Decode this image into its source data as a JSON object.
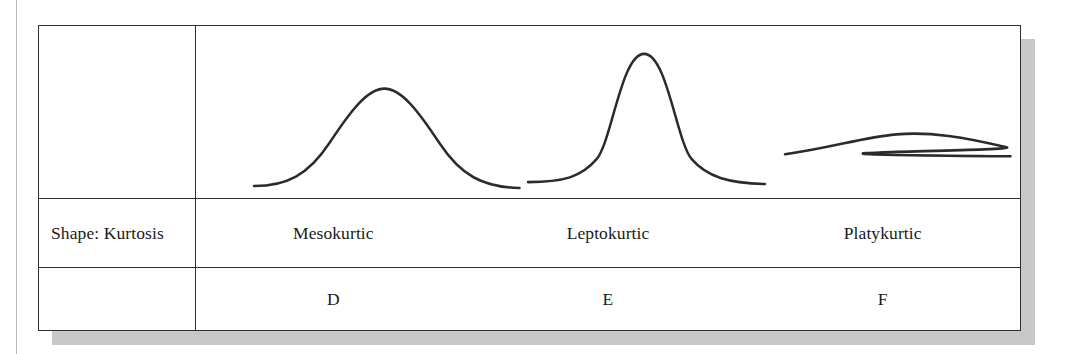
{
  "figure": {
    "kind": "kurtosis-comparison-table",
    "row_label": "Shape: Kurtosis",
    "empty_label": ""
  },
  "colors": {
    "line": "#2b2b2b",
    "border": "#2e2e2e",
    "shadow": "#c8c8c8",
    "background": "#ffffff",
    "gutter_rule": "#b9b9b9"
  },
  "columns": [
    {
      "id": "mesokurtic",
      "shape_name": "Mesokurtic",
      "letter": "D",
      "curve": {
        "description": "normal bell curve, moderate peak and moderate tails",
        "peak_height_rank": 2,
        "spread_rank": 2
      }
    },
    {
      "id": "leptokurtic",
      "shape_name": "Leptokurtic",
      "letter": "E",
      "curve": {
        "description": "tall narrow peak with long thin tails",
        "peak_height_rank": 1,
        "spread_rank": 3
      }
    },
    {
      "id": "platykurtic",
      "shape_name": "Platykurtic",
      "letter": "F",
      "curve": {
        "description": "very flat low broad curve",
        "peak_height_rank": 3,
        "spread_rank": 1
      }
    }
  ],
  "chart_data": {
    "type": "line",
    "title": "",
    "xlabel": "",
    "ylabel": "",
    "grid": false,
    "legend": "none",
    "series": [
      {
        "name": "Mesokurtic",
        "path": "M 61 161 C 95 161 118 150 140 118 C 162 86 180 63 198 63 C 216 63 234 86 256 118 C 278 150 301 162 340 163",
        "x_start": 61,
        "x_end": 340,
        "peak_x": 198,
        "peak_y": 63,
        "baseline_y": 162
      },
      {
        "name": "Leptokurtic",
        "path": "M 349 157 C 386 157 405 152 421 134 C 437 116 447 28 471 28 C 495 28 505 116 521 134 C 537 152 560 158 598 159",
        "x_start": 349,
        "x_end": 598,
        "peak_x": 471,
        "peak_y": 28,
        "baseline_y": 158
      },
      {
        "name": "Platykurtic",
        "path": "M 619 129 C 671 122 700 112 736 109 C 772 106 808 112 852 122 C 870 126 500 128 856 131",
        "x_start": 619,
        "x_end": 856,
        "peak_x": 736,
        "peak_y": 109,
        "baseline_y": 130
      }
    ]
  }
}
